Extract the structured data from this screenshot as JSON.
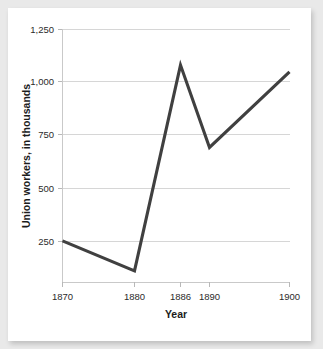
{
  "card": {
    "background": "#ffffff",
    "page_background": "#e9e9e9"
  },
  "chart_data": {
    "type": "line",
    "title": "",
    "subtitle": "",
    "xlabel": "Year",
    "ylabel": "Union workers, in thousands",
    "x": [
      1870,
      1880,
      1886,
      1890,
      1900
    ],
    "values": [
      300,
      165,
      1090,
      720,
      1060
    ],
    "series": [
      {
        "name": "Union workers",
        "values": [
          300,
          165,
          1090,
          720,
          1060
        ],
        "color": "#404040"
      }
    ],
    "x_tick_labels": [
      "1870",
      "1880",
      "1886",
      "1890",
      "1900"
    ],
    "y_tick_labels": [
      "250",
      "500",
      "750",
      "1,000",
      "1,250"
    ],
    "y_ticks": [
      250,
      500,
      750,
      1000,
      1250
    ],
    "xlim": [
      1870,
      1900
    ],
    "ylim": [
      115,
      1250
    ],
    "grid": true,
    "grid_axis": "y",
    "legend": false,
    "legend_position": "none",
    "line_color": "#404040",
    "grid_color": "#d6d6d6",
    "axis_color": "#c9c9c9",
    "markers": false,
    "annotations": []
  }
}
